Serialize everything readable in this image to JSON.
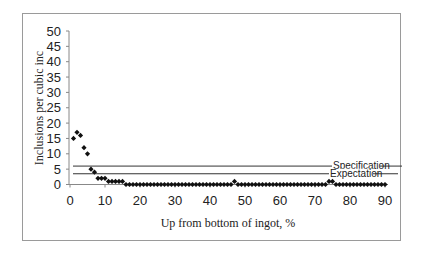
{
  "chart_data": {
    "type": "scatter",
    "title": "",
    "xlabel": "Up from bottom of ingot, %",
    "ylabel": "Inclusions per cubic inc",
    "xlim": [
      0,
      90
    ],
    "ylim": [
      0,
      50
    ],
    "xticks": [
      0,
      10,
      20,
      30,
      40,
      50,
      60,
      70,
      80,
      90
    ],
    "yticks": [
      0,
      5,
      10,
      15,
      20,
      25,
      30,
      35,
      40,
      45,
      50
    ],
    "grid": false,
    "legend": "none",
    "marker": "diamond",
    "marker_color": "#111111",
    "reference_lines": [
      {
        "name": "Specification",
        "y": 6
      },
      {
        "name": "Expectation",
        "y": 3.5
      }
    ],
    "series": [
      {
        "name": "Inclusions",
        "x": [
          1,
          2,
          3,
          4,
          5,
          6,
          7,
          8,
          9,
          10,
          11,
          12,
          13,
          14,
          15,
          16,
          17,
          18,
          19,
          20,
          21,
          22,
          23,
          24,
          25,
          26,
          27,
          28,
          29,
          30,
          31,
          32,
          33,
          34,
          35,
          36,
          37,
          38,
          39,
          40,
          41,
          42,
          43,
          44,
          45,
          46,
          47,
          48,
          49,
          50,
          51,
          52,
          53,
          54,
          55,
          56,
          57,
          58,
          59,
          60,
          61,
          62,
          63,
          64,
          65,
          66,
          67,
          68,
          69,
          70,
          71,
          72,
          73,
          74,
          75,
          76,
          77,
          78,
          79,
          80,
          81,
          82,
          83,
          84,
          85,
          86,
          87,
          88,
          89,
          90
        ],
        "values": [
          15,
          17,
          16,
          12,
          10,
          5,
          4,
          2,
          2,
          2,
          1,
          1,
          1,
          1,
          1,
          0,
          0,
          0,
          0,
          0,
          0,
          0,
          0,
          0,
          0,
          0,
          0,
          0,
          0,
          0,
          0,
          0,
          0,
          0,
          0,
          0,
          0,
          0,
          0,
          0,
          0,
          0,
          0,
          0,
          0,
          0,
          1,
          0,
          0,
          0,
          0,
          0,
          0,
          0,
          0,
          0,
          0,
          0,
          0,
          0,
          0,
          0,
          0,
          0,
          0,
          0,
          0,
          0,
          0,
          0,
          0,
          0,
          0,
          1,
          1,
          0,
          0,
          0,
          0,
          0,
          0,
          0,
          0,
          0,
          0,
          0,
          0,
          0,
          0,
          0
        ]
      }
    ]
  }
}
